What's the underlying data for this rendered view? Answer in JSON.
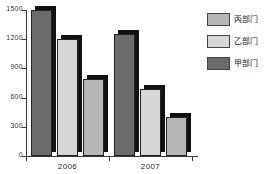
{
  "chart_data": {
    "type": "bar",
    "title": "",
    "subtitle": "",
    "xlabel": "",
    "ylabel": "",
    "categories": [
      "2006",
      "2007"
    ],
    "series": [
      {
        "name": "甲部门",
        "values": [
          1500,
          1250
        ],
        "color": "#6b6b6b"
      },
      {
        "name": "乙部门",
        "values": [
          1200,
          690
        ],
        "color": "#d6d6d6"
      },
      {
        "name": "丙部门",
        "values": [
          790,
          405
        ],
        "color": "#b6b6b6"
      }
    ],
    "ylim": [
      0,
      1500
    ],
    "yticks": [
      0,
      300,
      600,
      900,
      1200,
      1500
    ],
    "ytick_labels": [
      "0",
      "300",
      "600",
      "900",
      "1200",
      "1500"
    ],
    "grid": false,
    "legend_position": "right",
    "legend_order": [
      "丙部门",
      "乙部门",
      "甲部门"
    ]
  },
  "axis": {
    "y_labels": [
      "1500",
      "1200",
      "900",
      "600",
      "300",
      "0"
    ],
    "x_labels": [
      "2006",
      "2007"
    ]
  },
  "legend": {
    "items": [
      {
        "label": "丙部门",
        "swatch": "#b6b6b6"
      },
      {
        "label": "乙部门",
        "swatch": "#d6d6d6"
      },
      {
        "label": "甲部门",
        "swatch": "#6b6b6b"
      }
    ]
  }
}
